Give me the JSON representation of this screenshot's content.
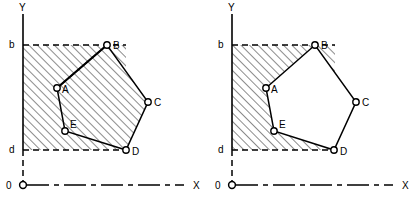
{
  "figure": {
    "panel_count": 2
  },
  "style": {
    "stroke_color": "#000000",
    "background_color": "#ffffff",
    "hatch_angle_deg": 45,
    "hatch_spacing_px": 6,
    "vertex_radius_px": 3.2
  },
  "panels": [
    {
      "id": "left",
      "name": "union-panel",
      "shaded_description": "union of band region and polygon",
      "origin_px": {
        "x": 23,
        "y": 185
      },
      "axes": {
        "y_label": "Y",
        "x_label": "X",
        "origin_label": "0",
        "y_label_pos": {
          "x": 19,
          "y": 11
        },
        "x_label_pos": {
          "x": 193,
          "y": 189
        },
        "origin_label_pos": {
          "x": 6,
          "y": 189
        }
      },
      "bounds": {
        "upper_label": "b",
        "lower_label": "d",
        "upper_y_px": 45,
        "lower_y_px": 150,
        "upper_label_pos": {
          "x": 9,
          "y": 48
        },
        "lower_label_pos": {
          "x": 9,
          "y": 153
        },
        "left_x_px": 23,
        "right_x_px": 126
      },
      "polygon": {
        "name": "ABCDE",
        "vertices": [
          {
            "label": "A",
            "x": 57,
            "y": 88,
            "label_x": 62,
            "label_y": 93
          },
          {
            "label": "B",
            "x": 107,
            "y": 45,
            "label_x": 113,
            "label_y": 49
          },
          {
            "label": "C",
            "x": 148,
            "y": 102,
            "label_x": 154,
            "label_y": 106
          },
          {
            "label": "D",
            "x": 126,
            "y": 150,
            "label_x": 132,
            "label_y": 155
          },
          {
            "label": "E",
            "x": 65,
            "y": 131,
            "label_x": 70,
            "label_y": 128
          }
        ]
      }
    },
    {
      "id": "right",
      "name": "difference-panel",
      "shaded_description": "band region minus polygon interior",
      "origin_px": {
        "x": 232,
        "y": 185
      },
      "axes": {
        "y_label": "Y",
        "x_label": "X",
        "origin_label": "0",
        "y_label_pos": {
          "x": 228,
          "y": 11
        },
        "x_label_pos": {
          "x": 402,
          "y": 189
        },
        "origin_label_pos": {
          "x": 215,
          "y": 189
        }
      },
      "bounds": {
        "upper_label": "b",
        "lower_label": "d",
        "upper_y_px": 45,
        "lower_y_px": 150,
        "upper_label_pos": {
          "x": 218,
          "y": 48
        },
        "lower_label_pos": {
          "x": 218,
          "y": 153
        },
        "left_x_px": 232,
        "right_x_px": 335
      },
      "polygon": {
        "name": "ABCDE",
        "vertices": [
          {
            "label": "A",
            "x": 266,
            "y": 88,
            "label_x": 271,
            "label_y": 93
          },
          {
            "label": "B",
            "x": 315,
            "y": 45,
            "label_x": 321,
            "label_y": 49
          },
          {
            "label": "C",
            "x": 356,
            "y": 102,
            "label_x": 362,
            "label_y": 106
          },
          {
            "label": "D",
            "x": 334,
            "y": 150,
            "label_x": 340,
            "label_y": 155
          },
          {
            "label": "E",
            "x": 274,
            "y": 131,
            "label_x": 279,
            "label_y": 128
          }
        ]
      }
    }
  ]
}
